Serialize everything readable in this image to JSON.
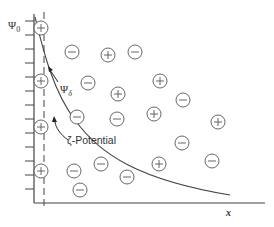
{
  "figure": {
    "labels": {
      "psi0": "Ψ",
      "psi0_sub": "0",
      "psi_delta": "Ψ",
      "psi_delta_sub": "δ",
      "zeta": "ζ-Potential",
      "x_axis": "x"
    },
    "colors": {
      "line": "#444444",
      "ion_stroke": "#555555",
      "background": "#ffffff"
    },
    "axis": {
      "origin": [
        34,
        203
      ],
      "y_top": 14,
      "x_right": 265,
      "ticks_y": [
        21,
        35,
        49,
        63,
        77,
        91,
        105,
        119,
        133,
        147,
        161,
        175,
        189
      ],
      "tick_length": 9
    },
    "stern_plane_x": 44,
    "ions": [
      {
        "sign": "+",
        "x": 41,
        "y": 28
      },
      {
        "sign": "+",
        "x": 41,
        "y": 81
      },
      {
        "sign": "+",
        "x": 41,
        "y": 127
      },
      {
        "sign": "+",
        "x": 41,
        "y": 171
      },
      {
        "sign": "−",
        "x": 72,
        "y": 52
      },
      {
        "sign": "+",
        "x": 108,
        "y": 55
      },
      {
        "sign": "−",
        "x": 135,
        "y": 52
      },
      {
        "sign": "−",
        "x": 88,
        "y": 83
      },
      {
        "sign": "+",
        "x": 118,
        "y": 94
      },
      {
        "sign": "+",
        "x": 160,
        "y": 81
      },
      {
        "sign": "−",
        "x": 183,
        "y": 100
      },
      {
        "sign": "−",
        "x": 77,
        "y": 117
      },
      {
        "sign": "−",
        "x": 117,
        "y": 119
      },
      {
        "sign": "+",
        "x": 154,
        "y": 114
      },
      {
        "sign": "+",
        "x": 218,
        "y": 122
      },
      {
        "sign": "−",
        "x": 182,
        "y": 143
      },
      {
        "sign": "−",
        "x": 74,
        "y": 171
      },
      {
        "sign": "−",
        "x": 101,
        "y": 164
      },
      {
        "sign": "−",
        "x": 127,
        "y": 177
      },
      {
        "sign": "+",
        "x": 159,
        "y": 164
      },
      {
        "sign": "−",
        "x": 212,
        "y": 161
      },
      {
        "sign": "−",
        "x": 80,
        "y": 190
      }
    ]
  }
}
